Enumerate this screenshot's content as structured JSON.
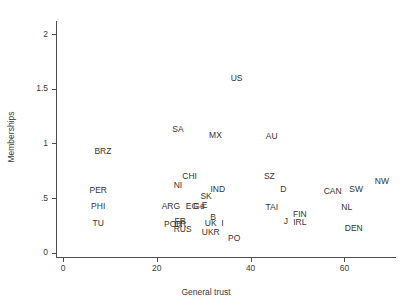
{
  "chart_data": {
    "type": "scatter",
    "title": "",
    "xlabel": "General trust",
    "ylabel": "Memberships",
    "xlim": [
      -1.5,
      71
    ],
    "ylim": [
      -0.04,
      2.12
    ],
    "grid": false,
    "legend": "none",
    "xticks": [
      0,
      20,
      40,
      60
    ],
    "xtick_labels": [
      "0",
      "20",
      "40",
      "60"
    ],
    "yticks": [
      0,
      0.5,
      1,
      1.5,
      2
    ],
    "ytick_labels": [
      "0",
      ".5",
      "1",
      "1.5",
      "2"
    ],
    "point_label_mode": "text-as-marker",
    "points": [
      {
        "label": "US",
        "x": 37.0,
        "y": 1.6
      },
      {
        "label": "SA",
        "x": 24.5,
        "y": 1.13
      },
      {
        "label": "MX",
        "x": 32.5,
        "y": 1.08
      },
      {
        "label": "AU",
        "x": 44.5,
        "y": 1.07
      },
      {
        "label": "BRZ",
        "x": 8.5,
        "y": 0.93
      },
      {
        "label": "CHI",
        "x": 27.0,
        "y": 0.7
      },
      {
        "label": "SZ",
        "x": 44.0,
        "y": 0.7
      },
      {
        "label": "NW",
        "x": 68.0,
        "y": 0.66
      },
      {
        "label": "NI",
        "x": 24.5,
        "y": 0.62
      },
      {
        "label": "PER",
        "x": 7.5,
        "y": 0.57
      },
      {
        "label": "IND",
        "x": 33.0,
        "y": 0.58
      },
      {
        "label": "D",
        "x": 47.0,
        "y": 0.58
      },
      {
        "label": "CAN",
        "x": 57.5,
        "y": 0.56
      },
      {
        "label": "SW",
        "x": 62.5,
        "y": 0.58
      },
      {
        "label": "SK",
        "x": 30.5,
        "y": 0.52
      },
      {
        "label": "PHI",
        "x": 7.5,
        "y": 0.43
      },
      {
        "label": "ARG",
        "x": 23.0,
        "y": 0.43
      },
      {
        "label": "EG",
        "x": 27.5,
        "y": 0.43
      },
      {
        "label": "Ge",
        "x": 29.0,
        "y": 0.43
      },
      {
        "label": "E",
        "x": 30.2,
        "y": 0.44
      },
      {
        "label": "TAI",
        "x": 44.5,
        "y": 0.42
      },
      {
        "label": "NL",
        "x": 60.5,
        "y": 0.42
      },
      {
        "label": "FIN",
        "x": 50.5,
        "y": 0.35
      },
      {
        "label": "B",
        "x": 32.0,
        "y": 0.33
      },
      {
        "label": "TU",
        "x": 7.5,
        "y": 0.27
      },
      {
        "label": "FR",
        "x": 25.0,
        "y": 0.29
      },
      {
        "label": "POR",
        "x": 23.5,
        "y": 0.26
      },
      {
        "label": "CR",
        "x": 25.0,
        "y": 0.26
      },
      {
        "label": "UK",
        "x": 31.5,
        "y": 0.27
      },
      {
        "label": "I",
        "x": 34.0,
        "y": 0.27
      },
      {
        "label": "J",
        "x": 47.5,
        "y": 0.29
      },
      {
        "label": "IRL",
        "x": 50.5,
        "y": 0.28
      },
      {
        "label": "RUS",
        "x": 25.5,
        "y": 0.22
      },
      {
        "label": "DEN",
        "x": 62.0,
        "y": 0.23
      },
      {
        "label": "UKR",
        "x": 31.5,
        "y": 0.19
      },
      {
        "label": "PO",
        "x": 36.5,
        "y": 0.13
      }
    ]
  },
  "colors": {
    "axis": "#4d4d4d",
    "text": "#333333",
    "background": "#ffffff"
  }
}
